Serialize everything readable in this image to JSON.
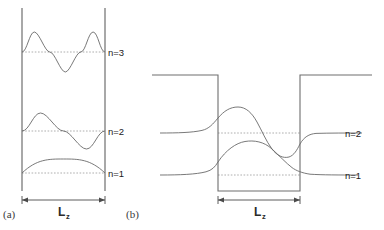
{
  "figure": {
    "background_color": "#ffffff",
    "wall_color": "#6e6e6e",
    "wave_color": "#5a5a5a",
    "baseline_color": "#9a9a9a",
    "arrow_color": "#4a4a4a",
    "text_color": "#1a1a1a"
  },
  "panels": [
    {
      "id": "a",
      "label": "(a)",
      "type": "infinite-square-well",
      "well": {
        "left_x": 22,
        "right_x": 105,
        "top_y": 8,
        "bottom_y": 191
      },
      "dimension": {
        "label": "L",
        "subscript": "z",
        "arrow_y": 200,
        "label_x": 63,
        "label_y": 215
      },
      "states": [
        {
          "n": 1,
          "label": "n=1",
          "baseline_y": 173,
          "amplitude": 14,
          "half_periods": 1,
          "label_x": 108,
          "label_y": 177
        },
        {
          "n": 2,
          "label": "n=2",
          "baseline_y": 131,
          "amplitude": 18,
          "half_periods": 2,
          "label_x": 108,
          "label_y": 135
        },
        {
          "n": 3,
          "label": "n=3",
          "baseline_y": 52,
          "amplitude": 20,
          "half_periods": 3,
          "label_x": 108,
          "label_y": 56
        }
      ]
    },
    {
      "id": "b",
      "label": "(b)",
      "type": "finite-square-well",
      "well": {
        "left_x": 218,
        "right_x": 300,
        "top_y": 75,
        "bottom_y": 191,
        "barrier_left_edge": 152,
        "barrier_right_edge": 372
      },
      "dimension": {
        "label": "L",
        "subscript": "z",
        "arrow_y": 200,
        "label_x": 259,
        "label_y": 215
      },
      "states": [
        {
          "n": 1,
          "label": "n=1",
          "baseline_y": 175,
          "amplitude": 18,
          "half_periods": 1,
          "tail_decay": 24,
          "label_x": 345,
          "label_y": 179
        },
        {
          "n": 2,
          "label": "n=2",
          "baseline_y": 133,
          "amplitude": 22,
          "half_periods": 2,
          "tail_decay": 26,
          "label_x": 345,
          "label_y": 137
        }
      ]
    }
  ]
}
